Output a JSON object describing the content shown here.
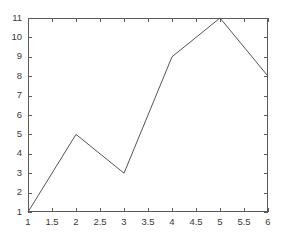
{
  "chart_data": {
    "type": "line",
    "title": "",
    "subtitle": "",
    "xlabel": "",
    "ylabel": "",
    "x": [
      1,
      2,
      3,
      4,
      5,
      6
    ],
    "values": [
      1,
      5,
      3,
      9,
      11,
      8
    ],
    "series": [
      {
        "name": "series-1",
        "x": [
          1,
          2,
          3,
          4,
          5,
          6
        ],
        "values": [
          1,
          5,
          3,
          9,
          11,
          8
        ],
        "color": "#555555"
      }
    ],
    "xlim": [
      1,
      6
    ],
    "ylim": [
      1,
      11
    ],
    "xticks": [
      1,
      1.5,
      2,
      2.5,
      3,
      3.5,
      4,
      4.5,
      5,
      5.5,
      6
    ],
    "xticklabels": [
      "1",
      "1.5",
      "2",
      "2.5",
      "3",
      "3.5",
      "4",
      "4.5",
      "5",
      "5.5",
      "6"
    ],
    "yticks": [
      1,
      2,
      3,
      4,
      5,
      6,
      7,
      8,
      9,
      10,
      11
    ],
    "yticklabels": [
      "1",
      "2",
      "3",
      "4",
      "5",
      "6",
      "7",
      "8",
      "9",
      "10",
      "11"
    ],
    "grid": false,
    "legend": null,
    "legend_position": "none",
    "annotations": [],
    "frame": "box-all-sides",
    "tick_direction": "in",
    "background_color": "#ffffff",
    "axis_color": "#5a5a5a",
    "tick_label_color": "#3a3a3a"
  },
  "figure": {
    "background_color": "#ffffff",
    "plot_area": {
      "left": 28,
      "top": 18,
      "right": 268,
      "bottom": 212
    }
  }
}
